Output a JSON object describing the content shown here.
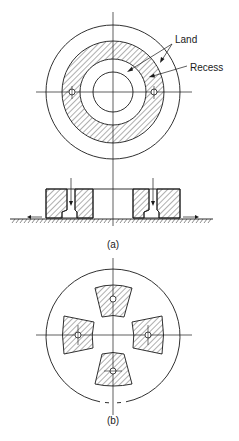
{
  "figure": {
    "labels": {
      "land": "Land",
      "recess": "Recess"
    },
    "captions": {
      "a": "(a)",
      "b": "(b)"
    },
    "colors": {
      "line": "#1a1a1a",
      "background": "#ffffff"
    },
    "views": [
      {
        "id": "a-plan",
        "description": "Annular recess bearing, plan view"
      },
      {
        "id": "a-section",
        "description": "Annular recess bearing, cross-section on sliding surface"
      },
      {
        "id": "b-plan",
        "description": "Four-pad bearing, plan view"
      }
    ]
  }
}
